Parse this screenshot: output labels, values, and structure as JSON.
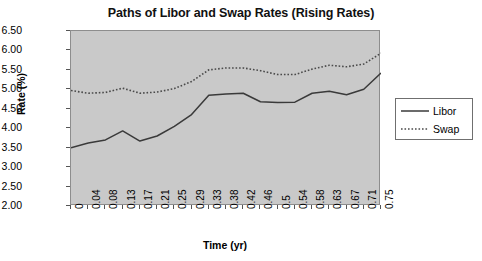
{
  "chart_data": {
    "type": "line",
    "title": "Paths of Libor and Swap Rates (Rising Rates)",
    "xlabel": "Time (yr)",
    "ylabel": "Rate (%)",
    "grid": false,
    "legend_position": "right",
    "ylim": [
      2.0,
      6.5
    ],
    "ytick_labels": [
      "2.00",
      "2.50",
      "3.00",
      "3.50",
      "4.00",
      "4.50",
      "5.00",
      "5.50",
      "6.00",
      "6.50"
    ],
    "ytick_values": [
      2.0,
      2.5,
      3.0,
      3.5,
      4.0,
      4.5,
      5.0,
      5.5,
      6.0,
      6.5
    ],
    "categories": [
      "0",
      "0.04",
      "0.08",
      "0.13",
      "0.17",
      "0.21",
      "0.25",
      "0.29",
      "0.33",
      "0.38",
      "0.42",
      "0.46",
      "0.5",
      "0.54",
      "0.58",
      "0.63",
      "0.67",
      "0.71",
      "0.75"
    ],
    "x": [
      0,
      0.04,
      0.08,
      0.13,
      0.17,
      0.21,
      0.25,
      0.29,
      0.33,
      0.38,
      0.42,
      0.46,
      0.5,
      0.54,
      0.58,
      0.63,
      0.67,
      0.71,
      0.75
    ],
    "series": [
      {
        "name": "Libor",
        "style": "solid",
        "color": "#3a3a3a",
        "values": [
          3.5,
          3.62,
          3.7,
          3.93,
          3.67,
          3.8,
          4.05,
          4.35,
          4.85,
          4.88,
          4.9,
          4.68,
          4.66,
          4.67,
          4.9,
          4.95,
          4.86,
          5.0,
          5.42
        ]
      },
      {
        "name": "Swap",
        "style": "dotted",
        "color": "#4a4a4a",
        "values": [
          4.97,
          4.9,
          4.92,
          5.03,
          4.9,
          4.93,
          5.02,
          5.2,
          5.5,
          5.55,
          5.55,
          5.48,
          5.38,
          5.38,
          5.52,
          5.62,
          5.58,
          5.65,
          5.93
        ]
      }
    ]
  },
  "legend": {
    "items": [
      {
        "label": "Libor"
      },
      {
        "label": "Swap"
      }
    ]
  }
}
